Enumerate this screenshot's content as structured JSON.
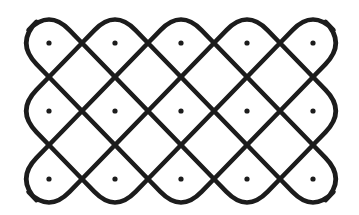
{
  "diagram": {
    "type": "kolam-dot-pattern",
    "background": "#ffffff",
    "stroke_color": "#1c1c1c",
    "dot_color": "#1c1c1c",
    "stroke_width": 4.6,
    "dot_radius": 2.6,
    "grid": {
      "columns": 5,
      "rows": 3,
      "origin_x": 49,
      "origin_y": 43,
      "spacing_x": 66,
      "spacing_y": 68
    },
    "corner_rounding": 0.62
  }
}
